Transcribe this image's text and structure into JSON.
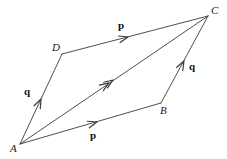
{
  "figure": {
    "background_color": "#ffffff",
    "stroke_color": "#3a3a3a",
    "label_color": "#1a1a1a",
    "width": 227,
    "height": 159
  },
  "vertices": [
    {
      "name": "A",
      "label": "A",
      "x": 20,
      "y": 144,
      "label_x": 10,
      "label_y": 143
    },
    {
      "name": "B",
      "label": "B",
      "x": 161,
      "y": 103,
      "label_x": 160,
      "label_y": 105
    },
    {
      "name": "C",
      "label": "C",
      "x": 208,
      "y": 16,
      "label_x": 211,
      "label_y": 5
    },
    {
      "name": "D",
      "label": "D",
      "x": 62,
      "y": 54,
      "label_x": 52,
      "label_y": 42
    }
  ],
  "edges": [
    {
      "name": "A-to-B",
      "from": "A",
      "to": "B",
      "x1": 20,
      "y1": 144,
      "x2": 161,
      "y2": 103
    },
    {
      "name": "B-to-C",
      "from": "B",
      "to": "C",
      "x1": 161,
      "y1": 103,
      "x2": 208,
      "y2": 16
    },
    {
      "name": "A-to-D",
      "from": "A",
      "to": "D",
      "x1": 20,
      "y1": 144,
      "x2": 62,
      "y2": 54
    },
    {
      "name": "D-to-C",
      "from": "D",
      "to": "C",
      "x1": 62,
      "y1": 54,
      "x2": 208,
      "y2": 16
    },
    {
      "name": "A-to-C-diagonal",
      "from": "A",
      "to": "C",
      "x1": 20,
      "y1": 144,
      "x2": 208,
      "y2": 16
    }
  ],
  "arrowheads": [
    {
      "name": "arrowhead-p-bottom",
      "on_edge": "A-to-B",
      "x": 97,
      "y": 122,
      "angle_deg": -16.2,
      "double": false
    },
    {
      "name": "arrowhead-q-right",
      "on_edge": "B-to-C",
      "x": 184,
      "y": 61,
      "angle_deg": -61.6,
      "double": false
    },
    {
      "name": "arrowhead-q-left",
      "on_edge": "A-to-D",
      "x": 41,
      "y": 99,
      "angle_deg": -65.0,
      "double": false
    },
    {
      "name": "arrowhead-p-top",
      "on_edge": "D-to-C",
      "x": 128,
      "y": 37,
      "angle_deg": -14.6,
      "double": false
    },
    {
      "name": "arrowhead-diagonal",
      "on_edge": "A-to-C-diagonal",
      "x": 113,
      "y": 80,
      "angle_deg": -34.2,
      "double": true
    }
  ],
  "vector_labels": [
    {
      "name": "vector-label-p-top",
      "text": "p",
      "x": 118,
      "y": 20
    },
    {
      "name": "vector-label-p-bottom",
      "text": "p",
      "x": 90,
      "y": 130
    },
    {
      "name": "vector-label-q-left",
      "text": "q",
      "x": 24,
      "y": 86
    },
    {
      "name": "vector-label-q-right",
      "text": "q",
      "x": 189,
      "y": 61
    }
  ]
}
